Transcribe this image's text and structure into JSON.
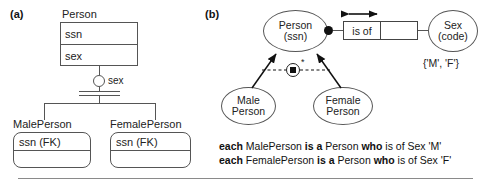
{
  "figure": {
    "panel_a_label": "(a)",
    "panel_b_label": "(b)"
  },
  "panel_a": {
    "supertype": {
      "title": "Person",
      "attributes": [
        "ssn",
        "sex"
      ]
    },
    "discriminator": {
      "label": "sex",
      "icon": "circle-discriminator-icon"
    },
    "subtypes": [
      {
        "title": "MalePerson",
        "attributes": [
          "ssn (FK)",
          ""
        ]
      },
      {
        "title": "FemalePerson",
        "attributes": [
          "ssn (FK)",
          ""
        ]
      }
    ]
  },
  "panel_b": {
    "entities": [
      {
        "name": "Person",
        "reference_mode": "(ssn)"
      },
      {
        "name": "Sex",
        "reference_mode": "(code)"
      }
    ],
    "subtype_entities": [
      {
        "line1": "Male",
        "line2": "Person"
      },
      {
        "line1": "Female",
        "line2": "Person"
      }
    ],
    "predicate": {
      "reading": "is of",
      "second_cell": "",
      "uniqueness_bar": "double-headed-arrow-icon"
    },
    "mandatory_role_dot": "filled-dot-icon",
    "value_constraint": "{'M', 'F'}",
    "exclusion_constraint": {
      "icon": "exclusion-constraint-icon",
      "marker": "*"
    },
    "verbalizations": [
      {
        "b1": "each",
        "t1": " MalePerson ",
        "b2": "is a",
        "t2": " Person ",
        "b3": "who",
        "t3": " is of Sex 'M'"
      },
      {
        "b1": "each",
        "t1": " FemalePerson ",
        "b2": "is a",
        "t2": " Person ",
        "b3": "who",
        "t3": " is of Sex 'F'"
      }
    ]
  },
  "colors": {
    "stroke": "#555555",
    "ink": "#1a1a1a",
    "fill": "#ffffff",
    "rule": "#8a8a8a"
  }
}
